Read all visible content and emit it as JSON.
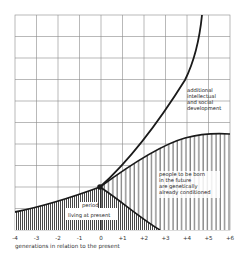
{
  "diagram": {
    "type": "generational-influence-diagram",
    "x_axis": {
      "title": "generations in relation to the present",
      "ticks": [
        "-4",
        "-3",
        "-2",
        "-1",
        "0",
        "+1",
        "+2",
        "+3",
        "+4",
        "+5",
        "+6"
      ],
      "range": [
        -4,
        6
      ]
    },
    "grid": {
      "columns": 10,
      "rows": 10
    },
    "labels": {
      "living": [
        "period",
        "living at present"
      ],
      "future": [
        "people to be born",
        "in the future",
        "are genetically",
        "already conditioned"
      ],
      "development": [
        "additional",
        "intellectual",
        "and social",
        "development"
      ]
    },
    "regions": {
      "living_at_present": "dense vertical hatching, rising from -4 to 0 then descending to about +2.5",
      "future_born": "sparse vertical hatching between 0 and +6, bounded above by a saturating curve"
    },
    "curves": {
      "development": "steep rising curve from the present (0) to the top of the chart near +4.2",
      "genetic": "saturating curve from the present (0) leveling off near +5 to +6"
    },
    "colors": {
      "ink": "#1a1a1a",
      "grid": "#8a8a8a",
      "background": "#ffffff"
    }
  }
}
